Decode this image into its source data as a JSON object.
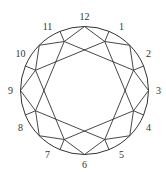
{
  "diagram": {
    "type": "brilliant-cut-facet-diagram",
    "center": [
      84.5,
      90.5
    ],
    "radius": 64,
    "inner_radius": 53,
    "label_radius": 74,
    "stroke_color": "#333333",
    "labels": [
      "12",
      "1",
      "2",
      "3",
      "4",
      "5",
      "6",
      "7",
      "8",
      "9",
      "10",
      "11"
    ]
  }
}
